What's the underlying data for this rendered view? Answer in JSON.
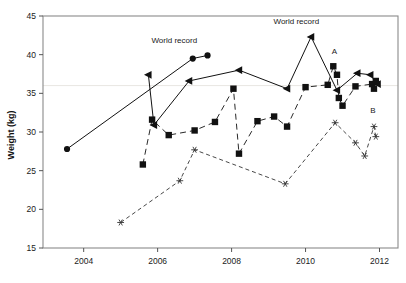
{
  "chart_data": {
    "type": "scatter",
    "title": "",
    "xlabel": "",
    "ylabel": "Weight (kg)",
    "xlim": [
      2002.9,
      2012.5
    ],
    "ylim": [
      15,
      45
    ],
    "xticks": [
      2004,
      2006,
      2008,
      2010,
      2012
    ],
    "xticklabels": [
      "2004",
      "2006",
      "2008",
      "2010",
      "2012"
    ],
    "yticks": [
      15,
      20,
      25,
      30,
      35,
      40,
      45
    ],
    "yticklabels": [
      "15",
      "20",
      "25",
      "30",
      "35",
      "40",
      "45"
    ],
    "grid": "single faint horizontal gridline at y=36",
    "gridline_y": 36,
    "legend": "none",
    "series": [
      {
        "name": "circle-series",
        "marker": "circle",
        "linestyle": "solid",
        "color": "#111111",
        "points": [
          {
            "x": 2003.55,
            "y": 27.8
          },
          {
            "x": 2006.95,
            "y": 39.5
          },
          {
            "x": 2007.35,
            "y": 39.9
          }
        ]
      },
      {
        "name": "triangle-series",
        "marker": "triangle-left",
        "linestyle": "solid",
        "color": "#111111",
        "points": [
          {
            "x": 2005.75,
            "y": 37.4
          },
          {
            "x": 2005.9,
            "y": 30.9
          },
          {
            "x": 2006.85,
            "y": 36.6
          },
          {
            "x": 2008.2,
            "y": 38.0
          },
          {
            "x": 2009.5,
            "y": 35.6
          },
          {
            "x": 2010.15,
            "y": 42.3
          },
          {
            "x": 2010.85,
            "y": 35.4
          },
          {
            "x": 2011.4,
            "y": 37.6
          },
          {
            "x": 2011.75,
            "y": 37.4
          },
          {
            "x": 2011.95,
            "y": 36.2
          }
        ]
      },
      {
        "name": "square-series",
        "marker": "square",
        "linestyle": "dashed",
        "color": "#111111",
        "points": [
          {
            "x": 2005.6,
            "y": 25.8
          },
          {
            "x": 2005.85,
            "y": 31.6
          },
          {
            "x": 2006.3,
            "y": 29.6
          },
          {
            "x": 2007.0,
            "y": 30.2
          },
          {
            "x": 2007.55,
            "y": 31.3
          },
          {
            "x": 2008.05,
            "y": 35.6
          },
          {
            "x": 2008.2,
            "y": 27.2
          },
          {
            "x": 2008.7,
            "y": 31.4
          },
          {
            "x": 2009.15,
            "y": 32.0
          },
          {
            "x": 2009.5,
            "y": 30.7
          },
          {
            "x": 2010.0,
            "y": 35.8
          },
          {
            "x": 2010.6,
            "y": 36.1
          },
          {
            "x": 2010.75,
            "y": 38.5
          },
          {
            "x": 2010.85,
            "y": 37.4
          },
          {
            "x": 2010.9,
            "y": 34.4
          },
          {
            "x": 2011.0,
            "y": 33.4
          },
          {
            "x": 2011.35,
            "y": 35.9
          },
          {
            "x": 2011.8,
            "y": 36.2
          },
          {
            "x": 2011.85,
            "y": 35.6
          },
          {
            "x": 2011.9,
            "y": 36.6
          }
        ]
      },
      {
        "name": "star-series",
        "marker": "star",
        "linestyle": "dotted",
        "color": "#333333",
        "points": [
          {
            "x": 2005.0,
            "y": 18.3
          },
          {
            "x": 2006.6,
            "y": 23.7
          },
          {
            "x": 2007.0,
            "y": 27.7
          },
          {
            "x": 2009.45,
            "y": 23.3
          },
          {
            "x": 2010.8,
            "y": 31.2
          },
          {
            "x": 2011.35,
            "y": 28.6
          },
          {
            "x": 2011.6,
            "y": 26.9
          },
          {
            "x": 2011.85,
            "y": 30.7
          },
          {
            "x": 2011.9,
            "y": 29.4
          }
        ]
      }
    ],
    "annotations": [
      {
        "label": "World record",
        "x": 2006.45,
        "y": 41.5,
        "name": "world-record-label-1"
      },
      {
        "label": "World record",
        "x": 2009.75,
        "y": 44.0,
        "name": "world-record-label-2"
      },
      {
        "label": "A",
        "x": 2010.78,
        "y": 40.1,
        "name": "point-a-label"
      },
      {
        "label": "B",
        "x": 2011.82,
        "y": 32.4,
        "name": "point-b-label"
      }
    ]
  }
}
